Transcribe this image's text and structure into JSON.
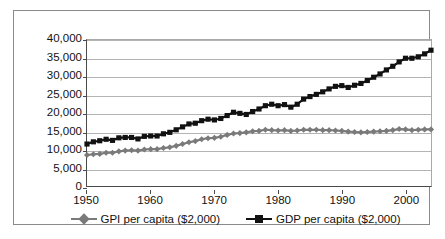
{
  "chart_data": {
    "type": "line",
    "title": "",
    "subtitle": "",
    "xlabel": "",
    "ylabel": "",
    "xlim": [
      1950,
      2004
    ],
    "ylim": [
      0,
      40000
    ],
    "grid": true,
    "legend_position": "bottom",
    "y_ticks": [
      0,
      5000,
      10000,
      15000,
      20000,
      25000,
      30000,
      35000,
      40000
    ],
    "y_tick_labels": [
      "0",
      "5,000",
      "10,000",
      "15,000",
      "20,000",
      "25,000",
      "30,000",
      "35,000",
      "40,000"
    ],
    "x_ticks": [
      1950,
      1960,
      1970,
      1980,
      1990,
      2000
    ],
    "x_tick_labels": [
      "1950",
      "1960",
      "1970",
      "1980",
      "1990",
      "2000"
    ],
    "x": [
      1950,
      1951,
      1952,
      1953,
      1954,
      1955,
      1956,
      1957,
      1958,
      1959,
      1960,
      1961,
      1962,
      1963,
      1964,
      1965,
      1966,
      1967,
      1968,
      1969,
      1970,
      1971,
      1972,
      1973,
      1974,
      1975,
      1976,
      1977,
      1978,
      1979,
      1980,
      1981,
      1982,
      1983,
      1984,
      1985,
      1986,
      1987,
      1988,
      1989,
      1990,
      1991,
      1992,
      1993,
      1994,
      1995,
      1996,
      1997,
      1998,
      1999,
      2000,
      2001,
      2002,
      2003,
      2004
    ],
    "series": [
      {
        "name": "GPI per capita ($2,000)",
        "color": "#7a7a7a",
        "marker": "diamond",
        "values": [
          8500,
          8700,
          8800,
          9100,
          9100,
          9500,
          9700,
          9800,
          9700,
          10000,
          10100,
          10100,
          10400,
          10600,
          11000,
          11500,
          12000,
          12300,
          12800,
          13100,
          13200,
          13500,
          14000,
          14400,
          14500,
          14700,
          15000,
          15100,
          15400,
          15300,
          15200,
          15300,
          15100,
          15200,
          15400,
          15400,
          15400,
          15300,
          15300,
          15200,
          15100,
          14900,
          14800,
          14700,
          14800,
          14900,
          15000,
          15100,
          15300,
          15600,
          15500,
          15300,
          15400,
          15500,
          15500
        ]
      },
      {
        "name": "GDP per capita ($2,000)",
        "color": "#111111",
        "marker": "square",
        "values": [
          11500,
          12100,
          12400,
          12800,
          12500,
          13200,
          13300,
          13300,
          12900,
          13600,
          13700,
          13700,
          14300,
          14700,
          15400,
          16200,
          17000,
          17200,
          17900,
          18300,
          18100,
          18500,
          19300,
          20200,
          19900,
          19600,
          20400,
          21100,
          22000,
          22400,
          22000,
          22300,
          21600,
          22400,
          23800,
          24500,
          25100,
          25800,
          26600,
          27300,
          27500,
          27000,
          27600,
          28100,
          28900,
          29800,
          30700,
          31800,
          32800,
          34000,
          35000,
          35000,
          35400,
          36200,
          37200
        ]
      }
    ]
  },
  "legend": {
    "entries": [
      {
        "label": "GPI per capita ($2,000)",
        "marker": "diamond-marker"
      },
      {
        "label": "GDP per capita ($2,000)",
        "marker": "square-marker"
      }
    ]
  }
}
